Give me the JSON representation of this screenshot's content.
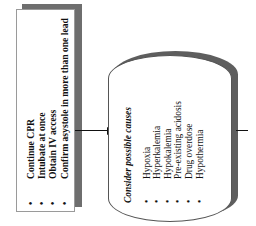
{
  "actions_box": {
    "items": [
      {
        "bullet": "•",
        "text": "Continue CPR"
      },
      {
        "bullet": "•",
        "text": "Intubate at once"
      },
      {
        "bullet": "•",
        "text": "Obtain IV access"
      },
      {
        "bullet": "•",
        "text": "Confirm asystole in more than one lead"
      }
    ]
  },
  "causes_box": {
    "title": "Consider possible causes",
    "items": [
      {
        "bullet": "•",
        "text": "Hypoxia"
      },
      {
        "bullet": "•",
        "text": "Hyperkalemia"
      },
      {
        "bullet": "•",
        "text": "Hypokalemia"
      },
      {
        "bullet": "•",
        "text": "Pre-existing acidosis"
      },
      {
        "bullet": "•",
        "text": "Drug overdose"
      },
      {
        "bullet": "•",
        "text": "Hypothermia"
      }
    ]
  },
  "colors": {
    "shadow": "#6e6e6e",
    "line": "#111111",
    "background": "#ffffff"
  }
}
